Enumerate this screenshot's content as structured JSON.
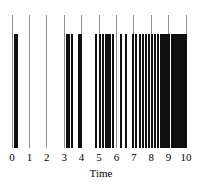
{
  "chart_data": {
    "type": "scatter",
    "subtype": "rug-plot-event-times",
    "title": "",
    "xlabel": "Time",
    "ylabel": "",
    "xlim": [
      0,
      10
    ],
    "ylim": [
      0,
      1
    ],
    "grid": false,
    "legend": null,
    "tick_labels": [
      "0",
      "1",
      "2",
      "3",
      "4",
      "5",
      "6",
      "7",
      "8",
      "9",
      "10"
    ],
    "ticks": [
      0,
      1,
      2,
      3,
      4,
      5,
      6,
      7,
      8,
      9,
      10
    ],
    "tick_marker_color": "#8e8e8e",
    "event_color": "#101010",
    "event_times": [
      0.18,
      0.28,
      3.15,
      3.3,
      3.42,
      3.85,
      3.96,
      4.85,
      5.05,
      5.22,
      5.4,
      5.52,
      5.62,
      5.78,
      6.25,
      6.55,
      6.95,
      7.1,
      7.35,
      7.52,
      7.7,
      7.88,
      8.05,
      8.2,
      8.38,
      8.55,
      8.68,
      8.8,
      8.92,
      9.05,
      9.18,
      9.3,
      9.42,
      9.55,
      9.64,
      9.72,
      9.8,
      9.88,
      9.95,
      10.0
    ],
    "event_count": 40
  },
  "geometry": {
    "plot_left_px": 12,
    "plot_right_px": 186,
    "tick_line_top_px": 15,
    "event_line_top_px": 34,
    "baseline_px": 148,
    "grid_line_width_px": 1,
    "event_line_width_px": 2
  }
}
